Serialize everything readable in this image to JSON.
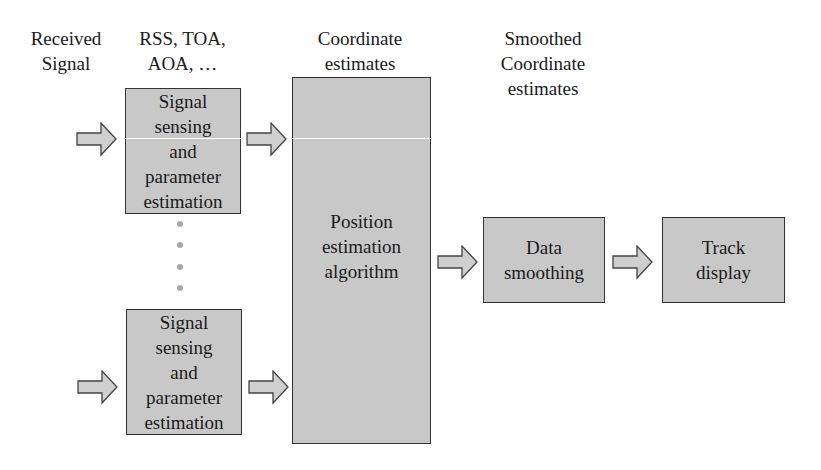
{
  "diagram": {
    "colors": {
      "box_fill": "#c8c8c8",
      "box_border": "#333333",
      "arrow_fill": "#cfcfcf",
      "dots": "#a8a8a8"
    },
    "column_labels": {
      "received_signal": [
        "Received",
        "Signal"
      ],
      "parameters": [
        "RSS, TOA,",
        "AOA, …"
      ],
      "coordinate_estimates": [
        "Coordinate",
        "estimates"
      ],
      "smoothed_estimates": [
        "Smoothed",
        "Coordinate",
        "estimates"
      ]
    },
    "blocks": {
      "signal_sensing_top": [
        "Signal",
        "sensing",
        "and",
        "parameter",
        "estimation"
      ],
      "signal_sensing_bottom": [
        "Signal",
        "sensing",
        "and",
        "parameter",
        "estimation"
      ],
      "position_estimation": [
        "Position",
        "estimation",
        "algorithm"
      ],
      "data_smoothing": [
        "Data",
        "smoothing"
      ],
      "track_display": [
        "Track",
        "display"
      ]
    },
    "ellipsis_dots": 4
  }
}
